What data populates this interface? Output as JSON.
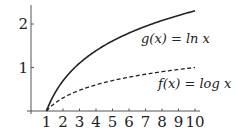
{
  "chart_data": {
    "type": "line",
    "title": "",
    "xlabel": "",
    "ylabel": "",
    "xlim": [
      0,
      10.2
    ],
    "ylim": [
      0,
      2.4
    ],
    "grid": false,
    "legend": "inline labels next to curves",
    "x_ticks": [
      1,
      2,
      3,
      4,
      5,
      6,
      7,
      8,
      9,
      10
    ],
    "y_ticks": [
      1,
      2
    ],
    "series": [
      {
        "name": "g(x) = ln x",
        "style": "solid",
        "function": "ln x",
        "x": [
          1,
          1.5,
          2,
          3,
          4,
          5,
          6,
          7,
          8,
          9,
          10
        ],
        "values": [
          0,
          0.405,
          0.693,
          1.099,
          1.386,
          1.609,
          1.792,
          1.946,
          2.079,
          2.197,
          2.303
        ]
      },
      {
        "name": "f(x) = log x",
        "style": "dashed",
        "function": "log10 x",
        "x": [
          1,
          1.5,
          2,
          3,
          4,
          5,
          6,
          7,
          8,
          9,
          10
        ],
        "values": [
          0,
          0.176,
          0.301,
          0.477,
          0.602,
          0.699,
          0.778,
          0.845,
          0.903,
          0.954,
          1.0
        ]
      }
    ],
    "annotations": [
      {
        "text": "g(x) = ln x",
        "near_series": "g(x) = ln x"
      },
      {
        "text": "f(x) = log x",
        "near_series": "f(x) = log x"
      }
    ]
  },
  "labels": {
    "g": "g(x) = ln x",
    "f": "f(x) = log x"
  },
  "colors": {
    "curve": "#222222",
    "axis": "#555555",
    "background": "#ffffff"
  }
}
